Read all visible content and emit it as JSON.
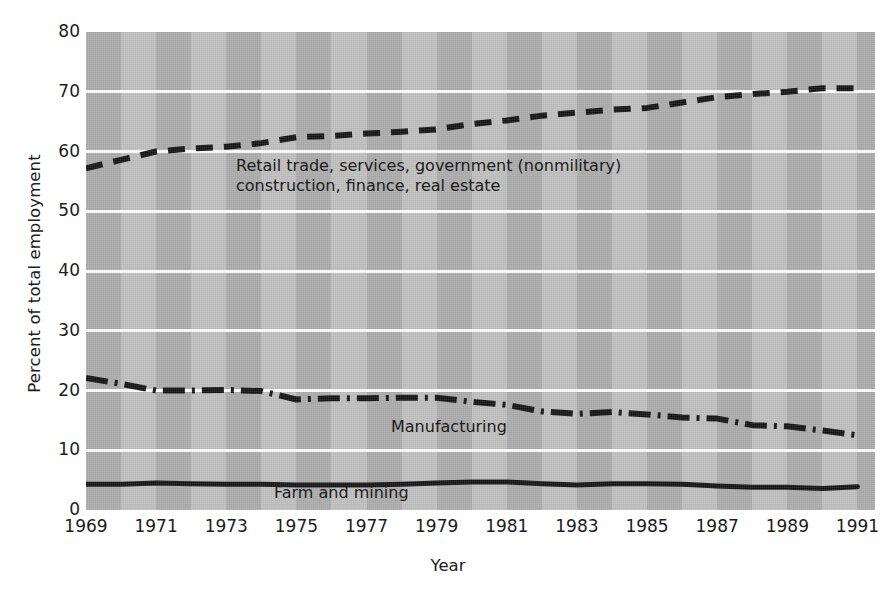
{
  "chart_data": {
    "type": "line",
    "title": "",
    "xlabel": "Year",
    "ylabel": "Percent of total employment",
    "xlim": [
      1969,
      1991.5
    ],
    "ylim": [
      0,
      80
    ],
    "ytick_values": [
      0,
      10,
      20,
      30,
      40,
      50,
      60,
      70,
      80
    ],
    "ytick_labels": [
      "0",
      "10",
      "20",
      "30",
      "40",
      "50",
      "60",
      "70",
      "80"
    ],
    "xtick_values": [
      1969,
      1971,
      1973,
      1975,
      1977,
      1979,
      1981,
      1983,
      1985,
      1987,
      1989,
      1991
    ],
    "xtick_labels": [
      "1969",
      "1971",
      "1973",
      "1975",
      "1977",
      "1979",
      "1981",
      "1983",
      "1985",
      "1987",
      "1989",
      "1991"
    ],
    "grid": "horizontal-white-gridlines",
    "legend": "inline-annotations",
    "background": "alternating vertical gray bands",
    "x": [
      1969,
      1970,
      1971,
      1972,
      1973,
      1974,
      1975,
      1976,
      1977,
      1978,
      1979,
      1980,
      1981,
      1982,
      1983,
      1984,
      1985,
      1986,
      1987,
      1988,
      1989,
      1990,
      1991
    ],
    "series": [
      {
        "name": "Retail trade, services, government (nonmilitary) construction, finance, real estate",
        "style": "dashed",
        "values": [
          57.2,
          58.6,
          60.0,
          60.5,
          60.8,
          61.4,
          62.4,
          62.6,
          63.0,
          63.3,
          63.7,
          64.6,
          65.2,
          66.0,
          66.5,
          67.0,
          67.3,
          68.2,
          69.1,
          69.6,
          70.0,
          70.6,
          70.6
        ]
      },
      {
        "name": "Manufacturing",
        "style": "dash-dot",
        "values": [
          22.1,
          21.1,
          20.0,
          20.0,
          20.1,
          19.9,
          18.5,
          18.7,
          18.7,
          18.8,
          18.8,
          18.1,
          17.6,
          16.5,
          16.1,
          16.4,
          16.0,
          15.5,
          15.3,
          14.2,
          14.0,
          13.3,
          12.5
        ]
      },
      {
        "name": "Farm and mining",
        "style": "solid",
        "values": [
          4.3,
          4.3,
          4.5,
          4.4,
          4.3,
          4.3,
          4.2,
          4.2,
          4.2,
          4.3,
          4.5,
          4.7,
          4.7,
          4.4,
          4.2,
          4.4,
          4.4,
          4.3,
          4.0,
          3.8,
          3.8,
          3.6,
          3.9
        ]
      }
    ],
    "annotations": [
      {
        "id": "top",
        "line1": "Retail trade, services, government (nonmilitary)",
        "line2": "construction, finance, real estate"
      },
      {
        "id": "manufacturing",
        "text": "Manufacturing"
      },
      {
        "id": "farm",
        "text": "Farm and mining"
      }
    ],
    "colors": {
      "line": "#101010",
      "band_dark": "#a9a9a9",
      "band_light": "#bdbdbd",
      "gridline": "#fbfbfb",
      "text": "#1c1c1c",
      "page_background": "#ffffff"
    }
  }
}
